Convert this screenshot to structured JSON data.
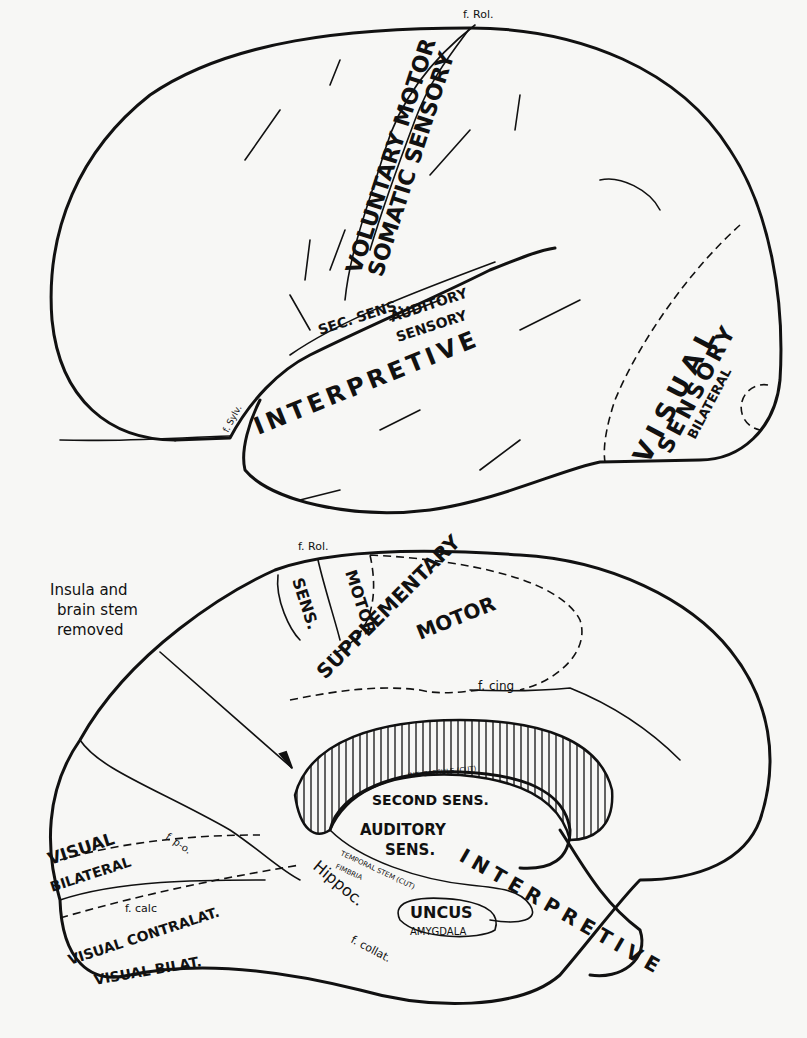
{
  "lateral_view": {
    "fissure_rolandic": "f. Rol.",
    "fissure_sylvian": "f. Sylv.",
    "areas": {
      "voluntary_motor": "VOLUNTARY MOTOR",
      "somatic_sensory": "SOMATIC SENSORY",
      "sec_sens": "SEC. SENS.",
      "auditory_sensory_1": "AUDITORY",
      "auditory_sensory_2": "SENSORY",
      "interpretive": "INTERPRETIVE",
      "visual_sensory_1": "VISUAL",
      "visual_sensory_2": "SENSORY",
      "visual_sensory_3": "BILATERAL"
    }
  },
  "medial_view": {
    "fissure_rolandic": "f. Rol.",
    "fissure_cingulate": "f. cing",
    "fissure_parieto_occipital": "f. p-o.",
    "fissure_calcarine": "f. calc",
    "fissure_collateral": "f. collat.",
    "annotation": {
      "line1": "Insula and",
      "line2": "brain stem",
      "line3": "removed"
    },
    "areas": {
      "sens": "SENS.",
      "motor": "MOTOR",
      "supplementary": "SUPPLEMENTARY",
      "supplementary_motor": "MOTOR",
      "int_capsule": "INT. CAPSULE (CUT)",
      "second_sens": "SECOND SENS.",
      "auditory_sens_1": "AUDITORY",
      "auditory_sens_2": "SENS.",
      "temporal_stem": "TEMPORAL STEM (CUT)",
      "fimbria": "FIMBRIA",
      "hippoc": "Hippoc.",
      "hippoc_symbol": "ɒ",
      "uncus": "UNCUS",
      "amygdala": "AMYGDALA",
      "interpretive_arc": "INTERPRETIVE",
      "visual_bilateral_1": "VISUAL",
      "visual_bilateral_2": "BILATERAL",
      "visual_contralat": "VISUAL CONTRALAT.",
      "visual_bilat": "VISUAL BILAT."
    }
  }
}
